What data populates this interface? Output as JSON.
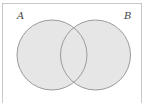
{
  "diagram": {
    "type": "venn",
    "sets": [
      {
        "id": "A",
        "label": "A",
        "cx": 52,
        "cy": 55,
        "r": 35
      },
      {
        "id": "B",
        "label": "B",
        "cx": 95.5,
        "cy": 55,
        "r": 35
      }
    ],
    "colors": {
      "fill": "#e6e6e6",
      "stroke": "#9a9a9a",
      "frame": "#c8c8c8",
      "label": "#444444"
    }
  }
}
